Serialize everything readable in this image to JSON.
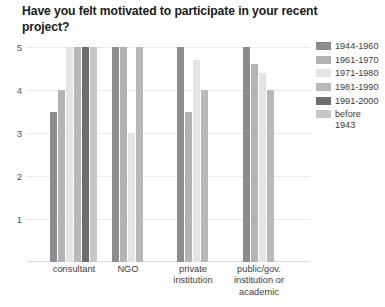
{
  "chart_data": {
    "type": "bar",
    "title": "Have you felt motivated to participate in your recent project?",
    "xlabel": "",
    "ylabel": "",
    "ylim": [
      0,
      5
    ],
    "yticks": [
      1,
      2,
      3,
      4,
      5
    ],
    "ytick_labels": [
      "1",
      "2",
      "3",
      "4",
      "5"
    ],
    "grid": true,
    "legend_position": "right",
    "categories": [
      "consultant",
      "NGO",
      "private\ninstitution",
      "public/gov.\ninstitution or\nacademic"
    ],
    "series": [
      {
        "name": "1944-1960",
        "color": "#8c8c8e",
        "values": [
          3.5,
          5.0,
          5.0,
          5.0
        ]
      },
      {
        "name": "1961-1970",
        "color": "#b3b3b5",
        "values": [
          4.0,
          5.0,
          3.5,
          4.6
        ]
      },
      {
        "name": "1971-1980",
        "color": "#e4e4e4",
        "values": [
          5.0,
          3.0,
          4.7,
          4.4
        ]
      },
      {
        "name": "1981-1990",
        "color": "#b9b9bb",
        "values": [
          5.0,
          5.0,
          4.0,
          4.0
        ]
      },
      {
        "name": "1991-2000",
        "color": "#6e6e70",
        "values": [
          5.0,
          null,
          null,
          null
        ]
      },
      {
        "name": "before\n1943",
        "color": "#c6c6c8",
        "values": [
          5.0,
          null,
          null,
          null
        ]
      }
    ]
  },
  "legend": {
    "items": [
      {
        "label": "1944-1960",
        "color": "#8c8c8e"
      },
      {
        "label": "1961-1970",
        "color": "#b3b3b5"
      },
      {
        "label": "1971-1980",
        "color": "#e4e4e4"
      },
      {
        "label": "1981-1990",
        "color": "#b9b9bb"
      },
      {
        "label": "1991-2000",
        "color": "#6e6e70"
      },
      {
        "label": "before\n1943",
        "color": "#c6c6c8"
      }
    ]
  }
}
